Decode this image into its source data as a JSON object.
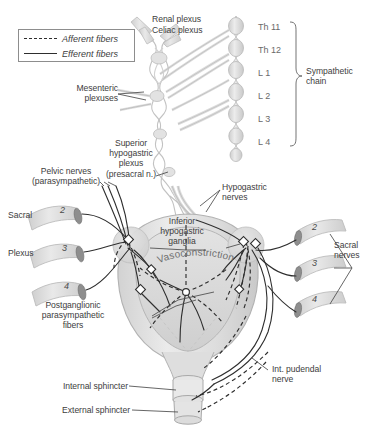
{
  "figure": {
    "background": "#ffffff",
    "ink": "#3d3d3d",
    "line_color": "#2e2e2e",
    "tissue_fill": "#e8e8e8",
    "tissue_stroke": "#b8b8b8",
    "nerve_fill": "#dcdcdc",
    "ganglion_fill": "#8e8e8e"
  },
  "legend": {
    "afferent_label": "Afferent fibers",
    "afferent_style": "dashed",
    "efferent_label": "Efferent fibers",
    "efferent_style": "solid"
  },
  "labels": {
    "renal_plexus": "Renal plexus",
    "celiac_plexus": "Celiac plexus",
    "mesenteric_plexuses": "Mesenteric\nplexuses",
    "sympathetic_chain": "Sympathetic\nchain",
    "superior_hypogastric": "Superior\nhypogastric\nplexus\n(presacral n.)",
    "hypogastric_nerves": "Hypogastric\nnerves",
    "inferior_hypogastric_ganglia": "Inferior\nhypogastric\nganglia",
    "vasoconstriction": "Vasoconstriction",
    "pelvic_nerves": "Pelvic nerves\n(parasympathetic)",
    "sacral": "Sacral",
    "plexus": "Plexus",
    "sacral_nerves": "Sacral\nnerves",
    "postganglionic": "Postganglionic\nparasympathetic\nfibers",
    "internal_sphincter": "Internal sphincter",
    "external_sphincter": "External sphincter",
    "int_pudendal_nerve": "Int. pudendal\nnerve"
  },
  "spinal_levels": [
    {
      "id": "th11",
      "label": "Th 11"
    },
    {
      "id": "th12",
      "label": "Th 12"
    },
    {
      "id": "l1",
      "label": "L 1"
    },
    {
      "id": "l2",
      "label": "L 2"
    },
    {
      "id": "l3",
      "label": "L 3"
    },
    {
      "id": "l4",
      "label": "L 4"
    }
  ],
  "sacral_roots_left": [
    {
      "id": "s2-left",
      "label": "2"
    },
    {
      "id": "s3-left",
      "label": "3"
    },
    {
      "id": "s4-left",
      "label": "4"
    }
  ],
  "sacral_roots_right": [
    {
      "id": "s2-right",
      "label": "2"
    },
    {
      "id": "s3-right",
      "label": "3"
    },
    {
      "id": "s4-right",
      "label": "4"
    }
  ]
}
